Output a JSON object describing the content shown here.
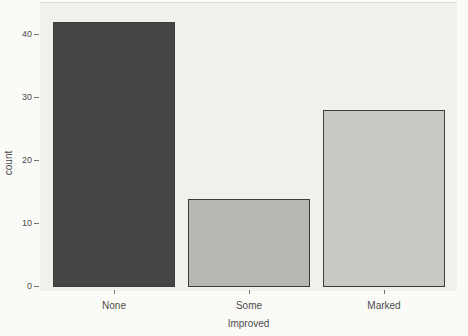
{
  "figure": {
    "background": "#fafaf7"
  },
  "chart_data": {
    "type": "bar",
    "title": "",
    "categories": [
      "None",
      "Some",
      "Marked"
    ],
    "values": [
      42,
      14,
      28
    ],
    "xlabel": "Improved",
    "ylabel": "count",
    "yticks": [
      0,
      10,
      20,
      30,
      40
    ],
    "ylim": [
      0,
      44
    ],
    "grid": "off",
    "legend": "none",
    "bar_fills": [
      "#454545",
      "#b7b7b4",
      "#c9c9c5"
    ],
    "bar_border": "#3c3c3c",
    "panel_background": "#f0f0ec",
    "text_color": "#4c4c4c",
    "tick_color": "#757575"
  }
}
